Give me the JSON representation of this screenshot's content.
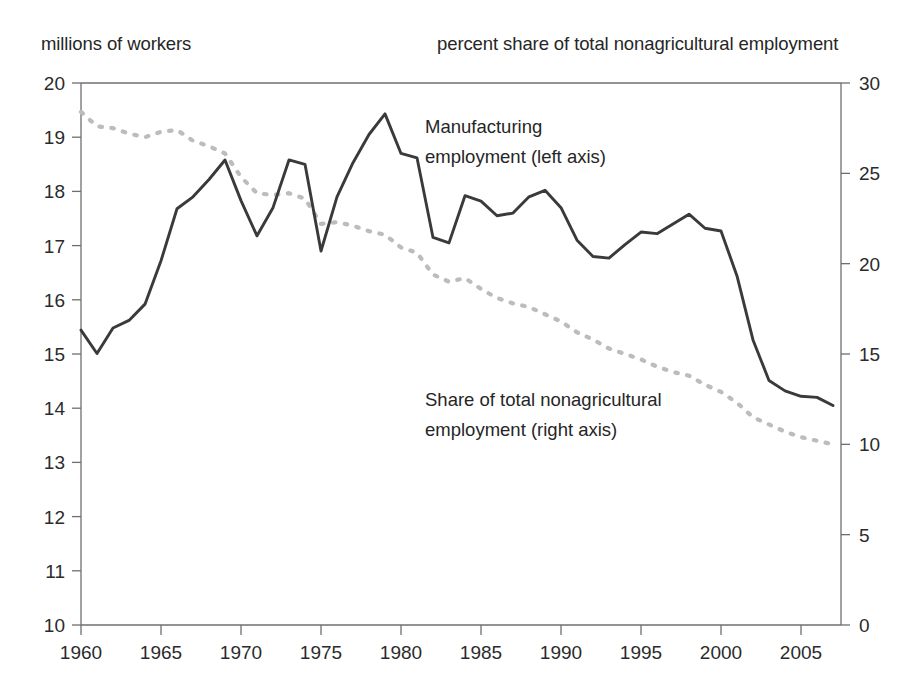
{
  "header": {
    "left_axis_title": "millions of workers",
    "right_axis_title": "percent share of total nonagricultural employment"
  },
  "annotations": {
    "solid_line_1": "Manufacturing",
    "solid_line_2": "employment (left axis)",
    "dashed_line_1": "Share of total nonagricultural",
    "dashed_line_2": "employment (right axis)"
  },
  "colors": {
    "solid_series": "#3a3a3a",
    "dashed_series": "#bcbcbc",
    "axis": "#6f6f6f",
    "text": "#2b2b2b",
    "background": "#ffffff"
  },
  "chart_data": {
    "type": "line",
    "title": "",
    "subtitle": "",
    "xlabel": "",
    "ylabel": "millions of workers",
    "y2label": "percent share of total nonagricultural employment",
    "xlim": [
      1960,
      2007.5
    ],
    "ylim": [
      10,
      20
    ],
    "y2lim": [
      0,
      30
    ],
    "xticks": [
      1960,
      1965,
      1970,
      1975,
      1980,
      1985,
      1990,
      1995,
      2000,
      2005
    ],
    "xticklabels": [
      "1960",
      "1965",
      "1970",
      "1975",
      "1980",
      "1985",
      "1990",
      "1995",
      "2000",
      "2005"
    ],
    "yticks": [
      10,
      11,
      12,
      13,
      14,
      15,
      16,
      17,
      18,
      19,
      20
    ],
    "yticklabels": [
      "10",
      "11",
      "12",
      "13",
      "14",
      "15",
      "16",
      "17",
      "18",
      "19",
      "20"
    ],
    "y2ticks": [
      0,
      5,
      10,
      15,
      20,
      25,
      30
    ],
    "y2ticklabels": [
      "0",
      "5",
      "10",
      "15",
      "20",
      "25",
      "30"
    ],
    "grid": false,
    "legend": "annotations-inline",
    "x": [
      1960,
      1961,
      1962,
      1963,
      1964,
      1965,
      1966,
      1967,
      1968,
      1969,
      1970,
      1971,
      1972,
      1973,
      1974,
      1975,
      1976,
      1977,
      1978,
      1979,
      1980,
      1981,
      1982,
      1983,
      1984,
      1985,
      1986,
      1987,
      1988,
      1989,
      1990,
      1991,
      1992,
      1993,
      1994,
      1995,
      1996,
      1997,
      1998,
      1999,
      2000,
      2001,
      2002,
      2003,
      2004,
      2005,
      2006,
      2007
    ],
    "series": [
      {
        "name": "Manufacturing employment (left axis)",
        "axis": "left",
        "style": "solid",
        "units": "millions of workers",
        "values": [
          15.44,
          15.01,
          15.48,
          15.62,
          15.92,
          16.72,
          17.68,
          17.9,
          18.22,
          18.58,
          17.83,
          17.18,
          17.7,
          18.58,
          18.5,
          16.9,
          17.9,
          18.53,
          19.05,
          19.43,
          18.7,
          18.62,
          17.15,
          17.05,
          17.92,
          17.82,
          17.55,
          17.6,
          17.9,
          18.02,
          17.7,
          17.1,
          16.8,
          16.77,
          17.02,
          17.25,
          17.22,
          17.4,
          17.58,
          17.32,
          17.27,
          16.44,
          15.26,
          14.51,
          14.32,
          14.22,
          14.2,
          14.05
        ]
      },
      {
        "name": "Share of total nonagricultural employment (right axis)",
        "axis": "right",
        "style": "dashed",
        "units": "percent",
        "values": [
          28.4,
          27.6,
          27.5,
          27.2,
          27.0,
          27.3,
          27.4,
          26.8,
          26.5,
          26.1,
          24.8,
          23.9,
          23.8,
          23.9,
          23.6,
          22.2,
          22.3,
          22.1,
          21.8,
          21.6,
          20.9,
          20.6,
          19.4,
          19.0,
          19.2,
          18.6,
          18.1,
          17.8,
          17.6,
          17.2,
          16.8,
          16.2,
          15.8,
          15.3,
          15.0,
          14.7,
          14.3,
          14.0,
          13.8,
          13.3,
          12.9,
          12.3,
          11.5,
          11.1,
          10.7,
          10.4,
          10.2,
          10.0
        ]
      }
    ]
  }
}
